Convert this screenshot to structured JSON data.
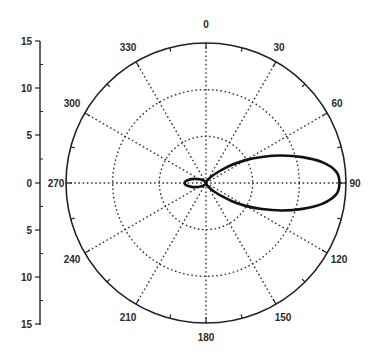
{
  "chart_data": {
    "type": "polar-line",
    "title": "",
    "angular_axis": {
      "direction": "clockwise",
      "zero_location": "top",
      "unit": "degrees",
      "tick_labels": [
        "0",
        "30",
        "60",
        "90",
        "120",
        "150",
        "180",
        "210",
        "240",
        "270",
        "300",
        "330"
      ],
      "tick_values": [
        0,
        30,
        60,
        90,
        120,
        150,
        180,
        210,
        240,
        270,
        300,
        330
      ],
      "minor_tick_step": 15
    },
    "radial_axis": {
      "range": [
        0,
        15
      ],
      "ring_values": [
        5,
        10,
        15
      ],
      "gridlines": "dotted",
      "left_axis_tick_labels": [
        "15",
        "10",
        "5",
        "0",
        "5",
        "10",
        "15"
      ],
      "left_axis_tick_values": [
        15,
        10,
        5,
        0,
        -5,
        -10,
        -15
      ]
    },
    "grid": true,
    "legend": null,
    "series": [
      {
        "name": "pattern",
        "color": "#111111",
        "theta": [
          0,
          10,
          20,
          30,
          40,
          45,
          50,
          55,
          60,
          65,
          70,
          75,
          80,
          85,
          90,
          95,
          100,
          105,
          110,
          115,
          120,
          125,
          130,
          135,
          140,
          150,
          160,
          170,
          180,
          190,
          200,
          210,
          220,
          230,
          240,
          250,
          255,
          260,
          265,
          270,
          275,
          280,
          285,
          290,
          300,
          310,
          320,
          330,
          340,
          350,
          360
        ],
        "r": [
          0.0,
          0.1,
          0.2,
          0.4,
          0.9,
          1.4,
          2.2,
          3.4,
          4.9,
          6.6,
          8.6,
          10.7,
          12.7,
          14.0,
          14.3,
          14.0,
          12.7,
          10.7,
          8.6,
          6.6,
          4.9,
          3.4,
          2.2,
          1.4,
          0.9,
          0.4,
          0.2,
          0.1,
          0.0,
          0.1,
          0.15,
          0.2,
          0.3,
          0.5,
          0.8,
          1.3,
          1.6,
          1.9,
          2.2,
          2.3,
          2.2,
          1.9,
          1.6,
          1.3,
          0.8,
          0.5,
          0.3,
          0.2,
          0.15,
          0.1,
          0.0
        ]
      }
    ]
  },
  "labels": {
    "angles": [
      {
        "text": "0",
        "x": 206,
        "y": 28
      },
      {
        "text": "30",
        "x": 279,
        "y": 51
      },
      {
        "text": "60",
        "x": 337,
        "y": 107
      },
      {
        "text": "90",
        "x": 355,
        "y": 187
      },
      {
        "text": "120",
        "x": 339,
        "y": 263
      },
      {
        "text": "150",
        "x": 283,
        "y": 321
      },
      {
        "text": "180",
        "x": 206,
        "y": 341
      },
      {
        "text": "210",
        "x": 128,
        "y": 321
      },
      {
        "text": "240",
        "x": 72,
        "y": 263
      },
      {
        "text": "270",
        "x": 56,
        "y": 187
      },
      {
        "text": "300",
        "x": 72,
        "y": 107
      },
      {
        "text": "330",
        "x": 128,
        "y": 51
      }
    ],
    "radial": [
      {
        "text": "15",
        "y": 41
      },
      {
        "text": "10",
        "y": 88
      },
      {
        "text": "5",
        "y": 135
      },
      {
        "text": "0",
        "y": 183
      },
      {
        "text": "5",
        "y": 230
      },
      {
        "text": "10",
        "y": 277
      },
      {
        "text": "15",
        "y": 324
      }
    ]
  },
  "colors": {
    "line": "#111111",
    "grid": "#333333",
    "frame": "#222222",
    "background": "#ffffff"
  }
}
